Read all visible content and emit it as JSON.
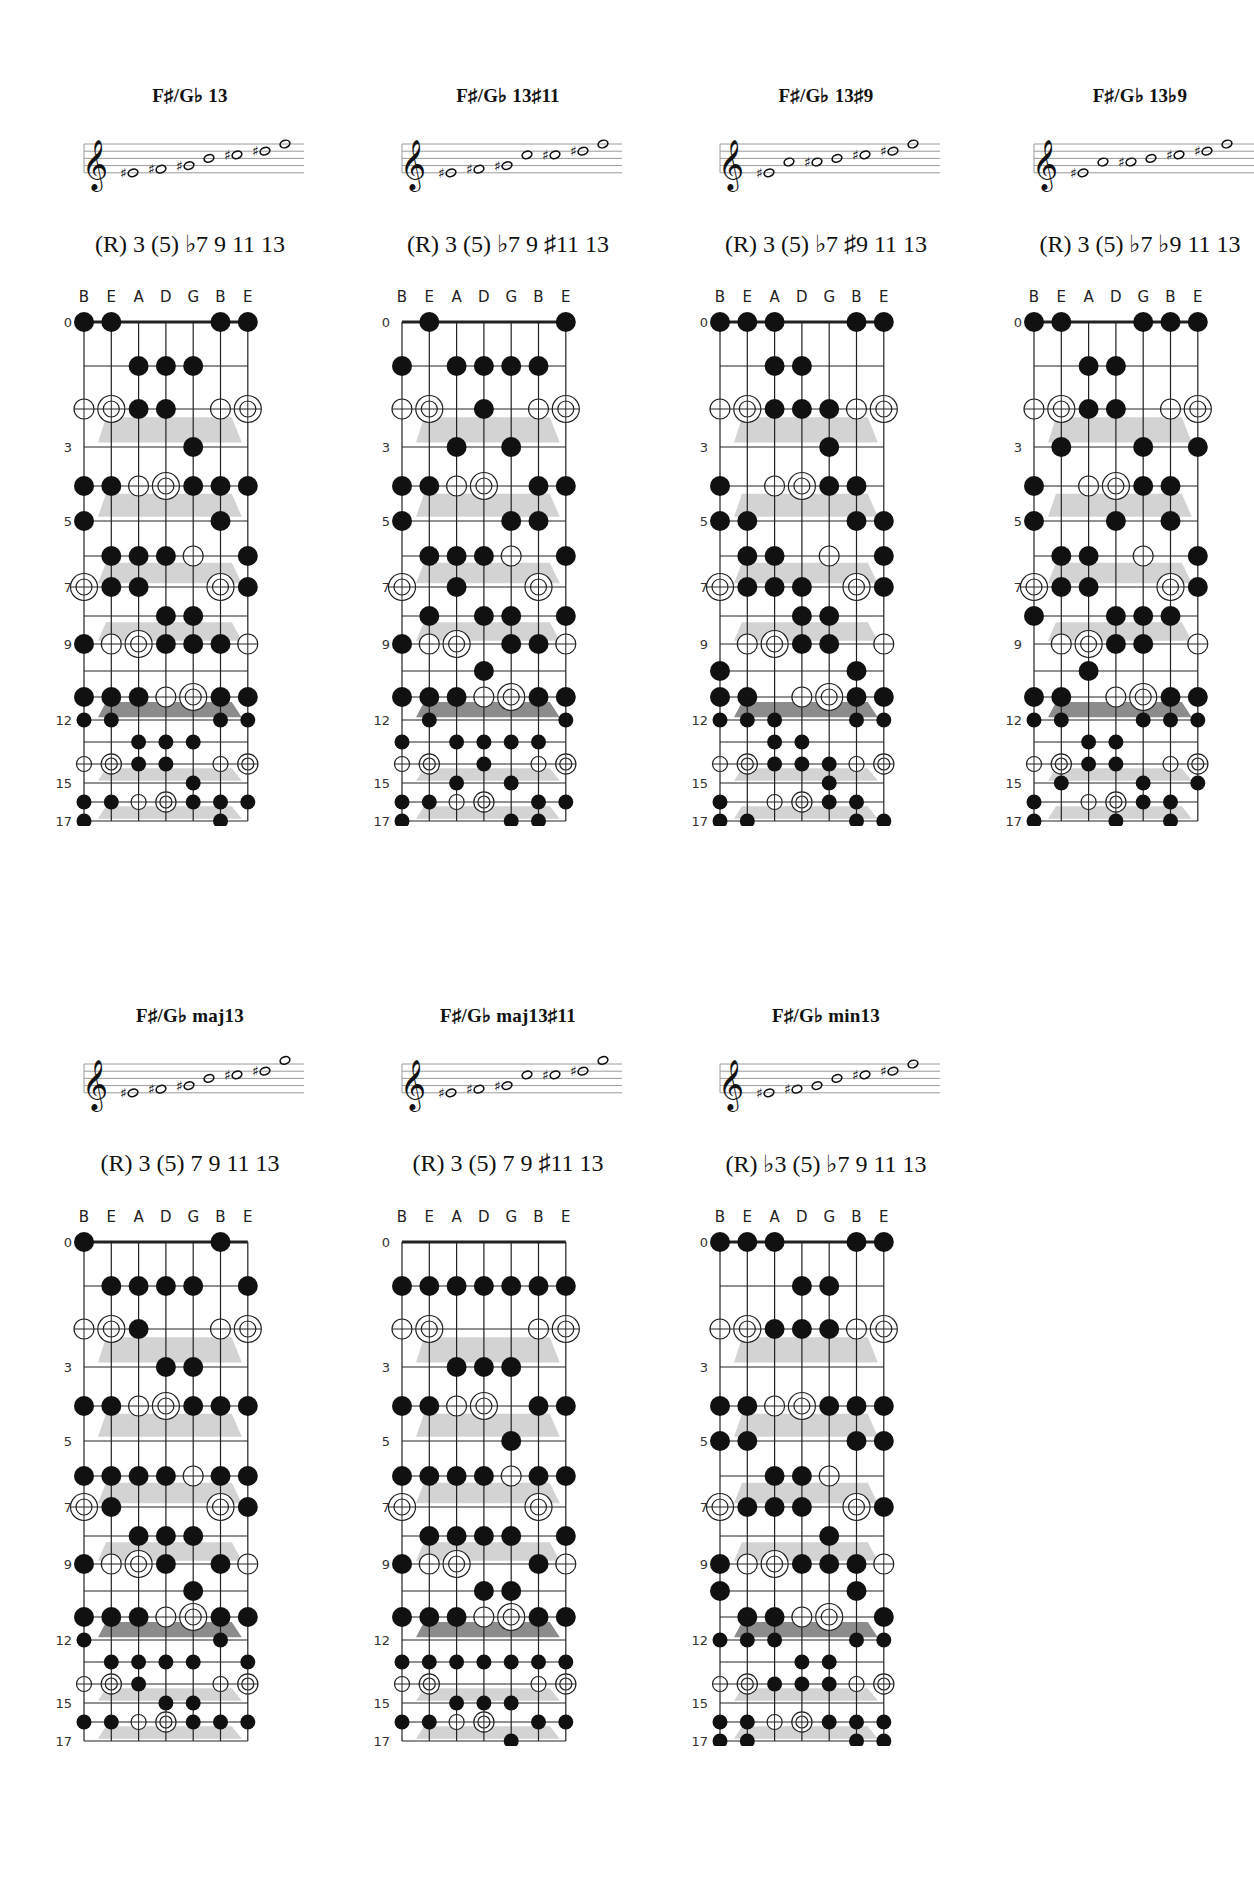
{
  "page": {
    "string_labels": [
      "B",
      "E",
      "A",
      "D",
      "G",
      "B",
      "E"
    ],
    "fret_markers": [
      {
        "fret": 0,
        "label": "0"
      },
      {
        "fret": 3,
        "label": "3"
      },
      {
        "fret": 5,
        "label": "5"
      },
      {
        "fret": 7,
        "label": "7"
      },
      {
        "fret": 9,
        "label": "9"
      },
      {
        "fret": 12,
        "label": "12"
      },
      {
        "fret": 15,
        "label": "15"
      },
      {
        "fret": 17,
        "label": "17"
      }
    ],
    "legend": {
      "x": "filled note",
      "o": "chord tone (open circle)",
      "R": "root (double circle)",
      ".": "no note"
    },
    "colors": {
      "ink": "#111111",
      "shade_light": "#d3d3d3",
      "shade_dark": "#8c8c8c",
      "staff_line": "#9a9a9a"
    }
  },
  "chords": [
    {
      "title": "F♯/G♭ 13",
      "intervals": "(R) 3 (5) ♭7 9 11 13",
      "staff_notes": [
        {
          "acc": "♯",
          "pos": 2
        },
        {
          "acc": "♯",
          "pos": 3
        },
        {
          "acc": "♯",
          "pos": 4
        },
        {
          "acc": "",
          "pos": 6
        },
        {
          "acc": "♯",
          "pos": 7
        },
        {
          "acc": "♯",
          "pos": 8
        },
        {
          "acc": "",
          "pos": 10
        }
      ],
      "frets": [
        "xx...xx",
        "..xxx..",
        "oRxx.oR",
        "....x..",
        "xxoRxxx",
        "x....x.",
        ".xxxo.x",
        "Rxx..Rx",
        "...xx..",
        "xoRxxxo",
        ".......",
        "xxxoRxx",
        "xx...xx",
        "..xxx..",
        "oRxx.oR",
        "....x..",
        "xxoRxxx",
        "x....x."
      ]
    },
    {
      "title": "F♯/G♭ 13♯11",
      "intervals": "(R) 3 (5) ♭7 9 ♯11 13",
      "staff_notes": [
        {
          "acc": "♯",
          "pos": 2
        },
        {
          "acc": "♯",
          "pos": 3
        },
        {
          "acc": "♯",
          "pos": 4
        },
        {
          "acc": "",
          "pos": 7
        },
        {
          "acc": "♯",
          "pos": 7
        },
        {
          "acc": "♯",
          "pos": 8
        },
        {
          "acc": "",
          "pos": 10
        }
      ],
      "frets": [
        ".x....x",
        "x.xxxx.",
        "oR.x.oR",
        "..x.x..",
        "xxoR.xx",
        "x...xx.",
        ".xxxo.x",
        "R.x..R.",
        ".x.xx.x",
        "xoR.xxo",
        "...x...",
        "xxxoRxx",
        ".x....x",
        "x.xxxx.",
        "oR.x.oR",
        "..x.x..",
        "xxoR.xx",
        "x...xx."
      ]
    },
    {
      "title": "F♯/G♭ 13♯9",
      "intervals": "(R) 3 (5) ♭7 ♯9 11 13",
      "staff_notes": [
        {
          "acc": "♯",
          "pos": 2
        },
        {
          "acc": "",
          "pos": 5
        },
        {
          "acc": "♯",
          "pos": 5
        },
        {
          "acc": "",
          "pos": 6
        },
        {
          "acc": "♯",
          "pos": 7
        },
        {
          "acc": "♯",
          "pos": 8
        },
        {
          "acc": "",
          "pos": 10
        }
      ],
      "frets": [
        "xxx..xx",
        "..xx...",
        "oRxxxoR",
        "....x..",
        "x.oRxx.",
        "xx...xx",
        ".xx.o.x",
        "Rxxx.Rx",
        "...xx..",
        ".oRxx.o",
        "x....x.",
        "xx.oRxx",
        "xxx..xx",
        "..xx...",
        "oRxxxoR",
        "....x..",
        "x.oRxx.",
        "xx...xx"
      ]
    },
    {
      "title": "F♯/G♭ 13♭9",
      "intervals": "(R) 3 (5) ♭7 ♭9 11 13",
      "staff_notes": [
        {
          "acc": "♯",
          "pos": 2
        },
        {
          "acc": "",
          "pos": 5
        },
        {
          "acc": "♯",
          "pos": 5
        },
        {
          "acc": "",
          "pos": 6
        },
        {
          "acc": "♯",
          "pos": 7
        },
        {
          "acc": "♯",
          "pos": 8
        },
        {
          "acc": "",
          "pos": 10
        }
      ],
      "frets": [
        "xx..xxx",
        "..xx...",
        "oRxx.oR",
        ".x..x.x",
        "x.oRxx.",
        "x..x.x.",
        ".xx.o.x",
        "Rxx..Rx",
        "x..xxx.",
        ".oRxx.o",
        "..x....",
        "xx.oRxx",
        "xx..xxx",
        "..xx...",
        "oRxx.oR",
        ".x..x.x",
        "x.oRxx.",
        "x..x.x."
      ]
    },
    {
      "title": "F♯/G♭ maj13",
      "intervals": "(R) 3 (5) 7 9 11 13",
      "staff_notes": [
        {
          "acc": "♯",
          "pos": 2
        },
        {
          "acc": "♯",
          "pos": 3
        },
        {
          "acc": "♯",
          "pos": 4
        },
        {
          "acc": "",
          "pos": 6
        },
        {
          "acc": "♯",
          "pos": 7
        },
        {
          "acc": "♯",
          "pos": 8
        },
        {
          "acc": "",
          "pos": 11
        }
      ],
      "frets": [
        "x....x.",
        ".xxxx.x",
        "oRx..oR",
        "...xx..",
        "xxoRxxx",
        ".......",
        "xxxxoxx",
        "Rx...Rx",
        "..xxx..",
        "xoRx.xo",
        "....x..",
        "xxxoRxx",
        "x....x.",
        ".xxxx.x",
        "oRx..oR",
        "...xx..",
        "xxoRxxx",
        "......."
      ]
    },
    {
      "title": "F♯/G♭ maj13♯11",
      "intervals": "(R) 3 (5) 7 9 ♯11 13",
      "staff_notes": [
        {
          "acc": "♯",
          "pos": 2
        },
        {
          "acc": "♯",
          "pos": 3
        },
        {
          "acc": "♯",
          "pos": 4
        },
        {
          "acc": "",
          "pos": 7
        },
        {
          "acc": "♯",
          "pos": 7
        },
        {
          "acc": "♯",
          "pos": 8
        },
        {
          "acc": "",
          "pos": 11
        }
      ],
      "frets": [
        ".......",
        "xxxxxxx",
        "oR...oR",
        "..xxx..",
        "xxoR.xx",
        "....x..",
        "xxxxoxx",
        "R....R.",
        ".xxxx.x",
        "xoR..xo",
        "...xx..",
        "xxxoRxx",
        ".......",
        "xxxxxxx",
        "oR...oR",
        "..xxx..",
        "xxoR.xx",
        "....x.."
      ]
    },
    {
      "title": "F♯/G♭ min13",
      "intervals": "(R) ♭3 (5) ♭7 9 11 13",
      "staff_notes": [
        {
          "acc": "♯",
          "pos": 2
        },
        {
          "acc": "♯",
          "pos": 3
        },
        {
          "acc": "",
          "pos": 4
        },
        {
          "acc": "",
          "pos": 6
        },
        {
          "acc": "♯",
          "pos": 7
        },
        {
          "acc": "♯",
          "pos": 8
        },
        {
          "acc": "",
          "pos": 10
        }
      ],
      "frets": [
        "xxx..xx",
        "...xx..",
        "oRxxxoR",
        ".......",
        "xxoRxxx",
        "xx...xx",
        "..xxo..",
        "Rxxx.Rx",
        "....x..",
        "xoRxxxo",
        "x....x.",
        ".xxoR.x",
        "xxx..xx",
        "...xx..",
        "oRxxxoR",
        ".......",
        "xxoRxxx",
        "xx...xx"
      ]
    }
  ]
}
